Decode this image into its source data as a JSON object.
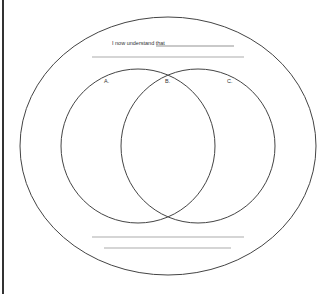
{
  "worksheet": {
    "prompt": "I now understand that",
    "labels": {
      "a": "A.",
      "b": "B.",
      "c": "C."
    },
    "colors": {
      "stroke": "#444444",
      "line": "#888888",
      "background": "#ffffff"
    }
  }
}
